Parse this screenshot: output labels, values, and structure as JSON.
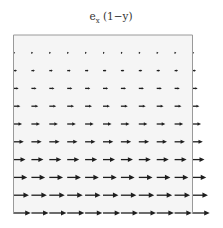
{
  "chart_data": {
    "type": "quiver",
    "title_parts": {
      "base": "e",
      "subscript": "x",
      "rest": " (1−y)"
    },
    "xlabel": "",
    "ylabel": "",
    "xlim": [
      0,
      1
    ],
    "ylim": [
      0,
      1
    ],
    "grid": false,
    "legend": "none",
    "field": {
      "u": "1 - y",
      "v": "0"
    },
    "x": [
      0,
      0.1,
      0.2,
      0.3,
      0.4,
      0.5,
      0.6,
      0.7,
      0.8,
      0.9,
      1.0
    ],
    "y": [
      0,
      0.1,
      0.2,
      0.3,
      0.4,
      0.5,
      0.6,
      0.7,
      0.8,
      0.9
    ],
    "rows": [
      {
        "y": 0.0,
        "u": 1.0
      },
      {
        "y": 0.1,
        "u": 0.9
      },
      {
        "y": 0.2,
        "u": 0.8
      },
      {
        "y": 0.3,
        "u": 0.7
      },
      {
        "y": 0.4,
        "u": 0.6
      },
      {
        "y": 0.5,
        "u": 0.5
      },
      {
        "y": 0.6,
        "u": 0.4
      },
      {
        "y": 0.7,
        "u": 0.3
      },
      {
        "y": 0.8,
        "u": 0.2
      },
      {
        "y": 0.9,
        "u": 0.1
      }
    ],
    "colors": {
      "arrow": "#1e1e1e",
      "frame": "#9a9a9a",
      "background": "#f5f5f5"
    }
  }
}
